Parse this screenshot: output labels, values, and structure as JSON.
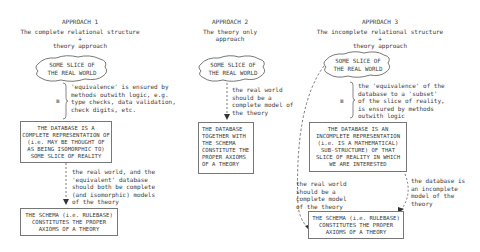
{
  "approaches": [
    {
      "heading": "APPROACH 1",
      "subtitle_line1": "The complete relational structure",
      "subtitle_plus": "+",
      "subtitle_line2": "theory approach",
      "cloud": "SOME SLICE OF\nTHE REAL WORLD",
      "equivalence_symbol": "≡",
      "equivalence_note": "'equivalence' is ensured by\nmethods outwith logic, e.g.\ntype checks, data validation,\ncheck digits, etc.",
      "database_box": "THE DATABASE IS A\nCOMPLETE REPRESENTATION OF\n(i.e. MAY BE THOUGHT OF\nAS BEING ISOMORPHIC TO)\nSOME SLICE OF REALITY",
      "model_note": "the real world, and the\n'equivalent' database\nshould both be complete\n(and isomorphic) models\nof the theory",
      "schema_box": "THE SCHEMA (i.e. RULEBASE)\nCONSTITUTES THE PROPER\nAXIOMS OF A THEORY"
    },
    {
      "heading": "APPROACH 2",
      "subtitle_line1": "The theory only",
      "subtitle_line2": "approach",
      "cloud": "SOME SLICE OF\nTHE REAL WORLD",
      "model_note": "the real world\nshould be a\ncomplete model of\nthe theory",
      "database_box": "THE DATABASE\nTOGETHER WITH\nTHE SCHEMA\nCONSTITUTE THE\nPROPER AXIOMS\nOF A THEORY"
    },
    {
      "heading": "APPROACH 3",
      "subtitle_line1": "The incomplete relational structure",
      "subtitle_plus": "+",
      "subtitle_line2": "theory approach",
      "cloud": "SOME SLICE OF\nTHE REAL WORLD",
      "equivalence_symbol": "≡",
      "equivalence_note": "the 'equivalence' of the\ndatabase to a 'subset'\nof the slice of reality,\nis ensured by methods\noutwith logic",
      "database_box": "THE DATABASE IS AN\nINCOMPLETE REPRESENTATION\n(i.e. IS A MATHEMATICAL)\nSUB-STRUCTURE) OF THAT\nSLICE OF REALITY IN WHICH\nWE ARE INTERESTED",
      "real_world_note": "the real world\nshould be a\ncomplete model\nof the theory",
      "database_note": "the database is\nan incomplete\nmodel of the\ntheory",
      "schema_box": "THE SCHEMA (i.e. RULEBASE)\nCONSTITUTES THE PROPER\nAXIOMS OF A THEORY"
    }
  ],
  "colors": {
    "line": "#555555",
    "text": "#3a3a3a",
    "background": "#ffffff"
  }
}
